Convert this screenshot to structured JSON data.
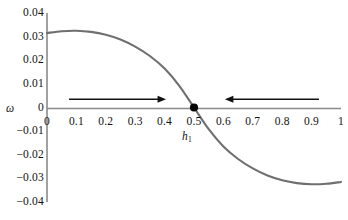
{
  "figure": {
    "background_color": "#ffffff",
    "axis_color": "#8a8a8a",
    "curve_color": "#6f6f6f",
    "arrow_color": "#111111",
    "marker_color": "#000000",
    "omega_label": "ω",
    "crossing_label_text": "h",
    "crossing_label_sub": "1"
  },
  "chart_data": {
    "type": "line",
    "title": "",
    "subtitle": "",
    "xlabel": "h₁",
    "ylabel": "ω",
    "xlim": [
      0,
      1
    ],
    "ylim": [
      -0.04,
      0.04
    ],
    "grid": false,
    "legend": null,
    "xticks": [
      "0",
      "0.1",
      "0.2",
      "0.3",
      "0.4",
      "0.5",
      "0.6",
      "0.7",
      "0.8",
      "0.9",
      "1"
    ],
    "xtick_values": [
      0,
      0.1,
      0.2,
      0.3,
      0.4,
      0.5,
      0.6,
      0.7,
      0.8,
      0.9,
      1
    ],
    "yticks": [
      "0.04",
      "0.03",
      "0.02",
      "0.01",
      "0",
      "−0.01",
      "−0.02",
      "−0.03",
      "−0.04"
    ],
    "ytick_values": [
      0.04,
      0.03,
      0.02,
      0.01,
      0,
      -0.01,
      -0.02,
      -0.03,
      -0.04
    ],
    "series": [
      {
        "name": "omega(h1)",
        "color": "#6f6f6f",
        "x": [
          0,
          0.05,
          0.1,
          0.15,
          0.2,
          0.25,
          0.3,
          0.35,
          0.4,
          0.45,
          0.5,
          0.55,
          0.6,
          0.65,
          0.7,
          0.75,
          0.8,
          0.85,
          0.9,
          0.95,
          1
        ],
        "values": [
          0.0315,
          0.0323,
          0.0325,
          0.032,
          0.0308,
          0.0288,
          0.0258,
          0.0218,
          0.0165,
          0.0092,
          0.0,
          -0.0092,
          -0.0165,
          -0.0218,
          -0.0258,
          -0.0288,
          -0.0308,
          -0.032,
          -0.0325,
          -0.0323,
          -0.0315
        ]
      }
    ],
    "annotations": [
      {
        "name": "zero-crossing-marker",
        "type": "point",
        "x": 0.5,
        "y": 0.0,
        "label": "h₁",
        "color": "#000000"
      },
      {
        "name": "left-arrow",
        "type": "arrow",
        "direction": "right",
        "x_start": 0.075,
        "x_end": 0.405,
        "y": 0.0035,
        "color": "#111111"
      },
      {
        "name": "right-arrow",
        "type": "arrow",
        "direction": "left",
        "x_start": 0.925,
        "x_end": 0.605,
        "y": 0.0035,
        "color": "#111111"
      }
    ]
  }
}
